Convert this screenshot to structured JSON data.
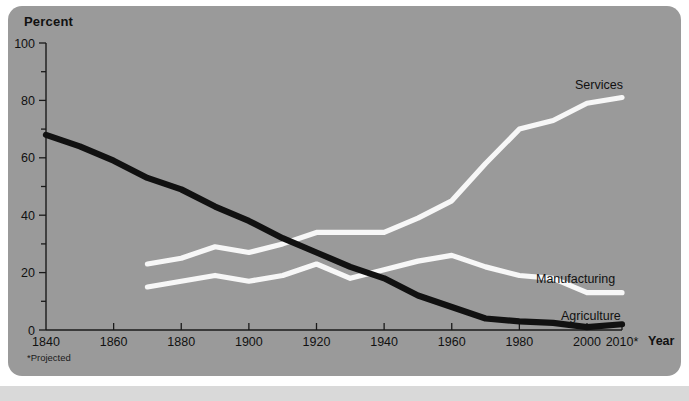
{
  "figure": {
    "y_axis_title": "Percent",
    "x_axis_title": "Year",
    "footnote": "*Projected",
    "colors": {
      "card_background": "#9a9a9a",
      "page_background": "#ffffff",
      "bottom_band": "#d9d9d9",
      "axis": "#1a1a1a",
      "agriculture_line": "#111111",
      "manufacturing_line": "#f7f7f7",
      "services_line": "#f7f7f7",
      "text": "#111111"
    }
  },
  "labels": {
    "services": "Services",
    "manufacturing": "Manufacturing",
    "agriculture": "Agriculture"
  },
  "chart_data": {
    "type": "line",
    "title": "",
    "subtitle": "",
    "xlabel": "Year",
    "ylabel": "Percent",
    "xlim": [
      1840,
      2012
    ],
    "ylim": [
      0,
      100
    ],
    "grid": false,
    "legend": "inline end-of-line labels",
    "y_ticks_major": [
      0,
      20,
      40,
      60,
      80,
      100
    ],
    "y_ticks_minor": [
      10,
      30,
      50,
      70,
      90
    ],
    "x_ticks": [
      1840,
      1860,
      1880,
      1900,
      1920,
      1940,
      1960,
      1980,
      2000,
      2010
    ],
    "x_tick_labels": [
      "1840",
      "1860",
      "1880",
      "1900",
      "1920",
      "1940",
      "1960",
      "1980",
      "2000",
      "2010*"
    ],
    "annotations": [
      "*Projected"
    ],
    "series": [
      {
        "name": "Agriculture",
        "color": "#111111",
        "style": "thick-solid",
        "x": [
          1840,
          1850,
          1860,
          1870,
          1880,
          1890,
          1900,
          1910,
          1920,
          1930,
          1940,
          1950,
          1960,
          1970,
          1980,
          1990,
          2000,
          2010
        ],
        "values": [
          68,
          64,
          59,
          53,
          49,
          43,
          38,
          32,
          27,
          22,
          18,
          12,
          8,
          4,
          3,
          2.5,
          1,
          2
        ]
      },
      {
        "name": "Manufacturing",
        "color": "#f7f7f7",
        "style": "solid",
        "x": [
          1870,
          1880,
          1890,
          1900,
          1910,
          1920,
          1930,
          1940,
          1950,
          1960,
          1970,
          1980,
          1990,
          2000,
          2010
        ],
        "values": [
          15,
          17,
          19,
          17,
          19,
          23,
          18,
          21,
          24,
          26,
          22,
          19,
          18,
          13,
          13
        ]
      },
      {
        "name": "Services",
        "color": "#f7f7f7",
        "style": "solid",
        "x": [
          1870,
          1880,
          1890,
          1900,
          1910,
          1920,
          1930,
          1940,
          1950,
          1960,
          1970,
          1980,
          1990,
          2000,
          2010
        ],
        "values": [
          23,
          25,
          29,
          27,
          30,
          34,
          34,
          34,
          39,
          45,
          58,
          70,
          73,
          79,
          81
        ]
      }
    ]
  }
}
